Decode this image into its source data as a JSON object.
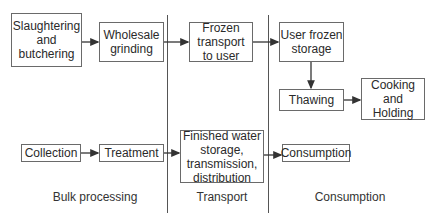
{
  "diagram": {
    "columns": [
      {
        "label": "Bulk processing"
      },
      {
        "label": "Transport"
      },
      {
        "label": "Consumption"
      }
    ],
    "food_chain": {
      "slaughtering": "Slaughtering\nand\nbutchering",
      "grinding": "Wholesale\ngrinding",
      "frozen_transport": "Frozen\ntransport\nto user",
      "user_storage": "User frozen\nstorage",
      "thawing": "Thawing",
      "cooking": "Cooking and\nHolding"
    },
    "water_chain": {
      "collection": "Collection",
      "treatment": "Treatment",
      "finished_water": "Finished water\nstorage,\ntransmission,\ndistribution",
      "consumption": "Consumption"
    }
  }
}
